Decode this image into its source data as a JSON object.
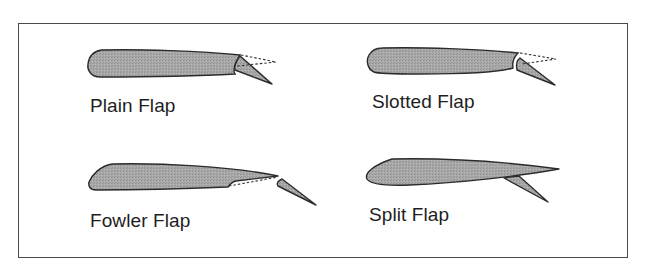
{
  "figure": {
    "colors": {
      "wing_fill": "#a6a6a6",
      "outline": "#2b2b2b",
      "frame": "#4a4a4a",
      "text": "#1e1e1e"
    },
    "panels": [
      {
        "id": "plain",
        "label": "Plain Flap"
      },
      {
        "id": "slotted",
        "label": "Slotted Flap"
      },
      {
        "id": "fowler",
        "label": "Fowler Flap"
      },
      {
        "id": "split",
        "label": "Split Flap"
      }
    ]
  }
}
